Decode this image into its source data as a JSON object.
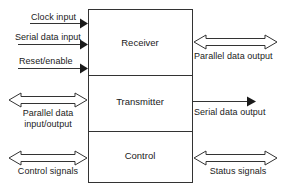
{
  "diagram": {
    "stroke_color": "#333333",
    "fill_color": "#ffffff",
    "text_color": "#1a1a1a",
    "blocks": [
      {
        "name": "receiver",
        "label": "Receiver"
      },
      {
        "name": "transmitter",
        "label": "Transmitter"
      },
      {
        "name": "control",
        "label": "Control"
      }
    ],
    "signals_left": [
      {
        "name": "clock-input",
        "label": "Clock input",
        "arrow": "solid-right"
      },
      {
        "name": "serial-data-input",
        "label": "Serial data input",
        "arrow": "solid-right"
      },
      {
        "name": "reset-enable",
        "label": "Reset/enable",
        "arrow": "solid-right"
      },
      {
        "name": "parallel-data-input-output",
        "label": "Parallel data",
        "label2": "input/output",
        "arrow": "hollow-bidirectional"
      },
      {
        "name": "control-signals",
        "label": "Control signals",
        "arrow": "hollow-bidirectional"
      }
    ],
    "signals_right": [
      {
        "name": "parallel-data-output",
        "label": "Parallel data output",
        "arrow": "hollow-bidirectional"
      },
      {
        "name": "serial-data-output",
        "label": "Serial data output",
        "arrow": "solid-right"
      },
      {
        "name": "status-signals",
        "label": "Status signals",
        "arrow": "hollow-bidirectional"
      }
    ]
  }
}
